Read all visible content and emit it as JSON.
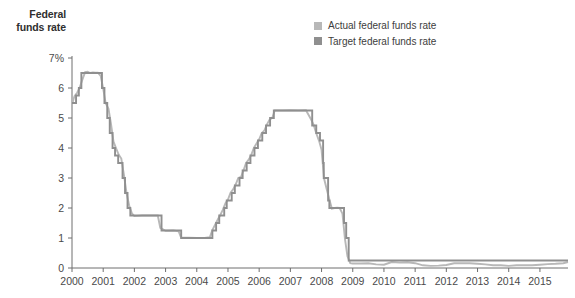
{
  "chart_data": {
    "type": "line",
    "title": "",
    "ylabel": "Federal funds rate",
    "xlabel": "",
    "ylim": [
      0,
      7
    ],
    "xlim": [
      2000,
      2015.9
    ],
    "grid": false,
    "legend_position": "top-center-right",
    "ytick_labels": [
      "7%",
      "6",
      "5",
      "4",
      "3",
      "2",
      "1",
      "0"
    ],
    "ytick_values": [
      7,
      6,
      5,
      4,
      3,
      2,
      1,
      0
    ],
    "xtick_labels": [
      "2000",
      "2001",
      "2002",
      "2003",
      "2004",
      "2005",
      "2006",
      "2007",
      "2008",
      "2009",
      "2010",
      "2011",
      "2012",
      "2013",
      "2014",
      "2015"
    ],
    "xtick_values": [
      2000,
      2001,
      2002,
      2003,
      2004,
      2005,
      2006,
      2007,
      2008,
      2009,
      2010,
      2011,
      2012,
      2013,
      2014,
      2015
    ],
    "colors": {
      "actual": "#b8b8b8",
      "target": "#8f8f8f",
      "axis": "#6e6e6e",
      "text": "#4a4a4a"
    },
    "series": [
      {
        "name": "Actual federal funds rate",
        "color": "#b8b8b8",
        "points": [
          [
            2000.0,
            5.45
          ],
          [
            2000.08,
            5.73
          ],
          [
            2000.17,
            5.85
          ],
          [
            2000.25,
            6.02
          ],
          [
            2000.33,
            6.27
          ],
          [
            2000.42,
            6.53
          ],
          [
            2000.5,
            6.54
          ],
          [
            2000.58,
            6.5
          ],
          [
            2000.67,
            6.52
          ],
          [
            2000.75,
            6.51
          ],
          [
            2000.83,
            6.51
          ],
          [
            2000.92,
            6.4
          ],
          [
            2001.0,
            5.98
          ],
          [
            2001.08,
            5.49
          ],
          [
            2001.17,
            5.31
          ],
          [
            2001.25,
            4.8
          ],
          [
            2001.33,
            4.21
          ],
          [
            2001.42,
            3.97
          ],
          [
            2001.5,
            3.77
          ],
          [
            2001.58,
            3.65
          ],
          [
            2001.67,
            3.07
          ],
          [
            2001.75,
            2.49
          ],
          [
            2001.83,
            2.09
          ],
          [
            2001.92,
            1.82
          ],
          [
            2002.0,
            1.73
          ],
          [
            2002.25,
            1.75
          ],
          [
            2002.5,
            1.75
          ],
          [
            2002.75,
            1.75
          ],
          [
            2002.83,
            1.34
          ],
          [
            2003.0,
            1.24
          ],
          [
            2003.25,
            1.25
          ],
          [
            2003.42,
            1.22
          ],
          [
            2003.5,
            1.01
          ],
          [
            2003.75,
            1.01
          ],
          [
            2004.0,
            1.0
          ],
          [
            2004.25,
            1.0
          ],
          [
            2004.42,
            1.03
          ],
          [
            2004.5,
            1.26
          ],
          [
            2004.58,
            1.43
          ],
          [
            2004.67,
            1.61
          ],
          [
            2004.75,
            1.76
          ],
          [
            2004.83,
            1.93
          ],
          [
            2004.92,
            2.16
          ],
          [
            2005.0,
            2.28
          ],
          [
            2005.08,
            2.5
          ],
          [
            2005.17,
            2.63
          ],
          [
            2005.25,
            2.79
          ],
          [
            2005.33,
            3.0
          ],
          [
            2005.42,
            3.04
          ],
          [
            2005.5,
            3.26
          ],
          [
            2005.58,
            3.5
          ],
          [
            2005.67,
            3.62
          ],
          [
            2005.75,
            3.78
          ],
          [
            2005.83,
            4.0
          ],
          [
            2005.92,
            4.16
          ],
          [
            2006.0,
            4.29
          ],
          [
            2006.08,
            4.49
          ],
          [
            2006.17,
            4.59
          ],
          [
            2006.25,
            4.79
          ],
          [
            2006.33,
            4.94
          ],
          [
            2006.42,
            5.0
          ],
          [
            2006.5,
            5.25
          ],
          [
            2006.58,
            5.25
          ],
          [
            2006.75,
            5.25
          ],
          [
            2007.0,
            5.26
          ],
          [
            2007.25,
            5.25
          ],
          [
            2007.5,
            5.26
          ],
          [
            2007.67,
            4.94
          ],
          [
            2007.75,
            4.76
          ],
          [
            2007.83,
            4.49
          ],
          [
            2007.92,
            4.24
          ],
          [
            2008.0,
            3.94
          ],
          [
            2008.08,
            2.98
          ],
          [
            2008.17,
            2.61
          ],
          [
            2008.25,
            2.28
          ],
          [
            2008.33,
            1.98
          ],
          [
            2008.42,
            2.0
          ],
          [
            2008.5,
            2.01
          ],
          [
            2008.58,
            2.0
          ],
          [
            2008.67,
            1.81
          ],
          [
            2008.75,
            0.97
          ],
          [
            2008.83,
            0.39
          ],
          [
            2008.92,
            0.16
          ],
          [
            2009.0,
            0.15
          ],
          [
            2009.25,
            0.15
          ],
          [
            2009.5,
            0.16
          ],
          [
            2009.75,
            0.12
          ],
          [
            2010.0,
            0.11
          ],
          [
            2010.25,
            0.2
          ],
          [
            2010.5,
            0.18
          ],
          [
            2010.75,
            0.19
          ],
          [
            2011.0,
            0.16
          ],
          [
            2011.25,
            0.09
          ],
          [
            2011.5,
            0.07
          ],
          [
            2011.75,
            0.08
          ],
          [
            2012.0,
            0.1
          ],
          [
            2012.25,
            0.16
          ],
          [
            2012.5,
            0.16
          ],
          [
            2012.75,
            0.16
          ],
          [
            2013.0,
            0.14
          ],
          [
            2013.25,
            0.12
          ],
          [
            2013.5,
            0.09
          ],
          [
            2013.75,
            0.09
          ],
          [
            2014.0,
            0.07
          ],
          [
            2014.25,
            0.09
          ],
          [
            2014.5,
            0.09
          ],
          [
            2014.75,
            0.09
          ],
          [
            2015.0,
            0.11
          ],
          [
            2015.25,
            0.13
          ],
          [
            2015.5,
            0.14
          ],
          [
            2015.75,
            0.16
          ],
          [
            2015.9,
            0.2
          ]
        ]
      },
      {
        "name": "Target federal funds rate",
        "color": "#8f8f8f",
        "points": [
          [
            2000.0,
            5.5
          ],
          [
            2000.13,
            5.5
          ],
          [
            2000.13,
            5.75
          ],
          [
            2000.22,
            5.75
          ],
          [
            2000.22,
            6.0
          ],
          [
            2000.3,
            6.0
          ],
          [
            2000.3,
            6.5
          ],
          [
            2000.96,
            6.5
          ],
          [
            2000.96,
            6.0
          ],
          [
            2001.04,
            6.0
          ],
          [
            2001.04,
            5.5
          ],
          [
            2001.13,
            5.5
          ],
          [
            2001.13,
            5.0
          ],
          [
            2001.21,
            5.0
          ],
          [
            2001.21,
            4.5
          ],
          [
            2001.3,
            4.5
          ],
          [
            2001.3,
            4.0
          ],
          [
            2001.38,
            4.0
          ],
          [
            2001.38,
            3.75
          ],
          [
            2001.48,
            3.75
          ],
          [
            2001.48,
            3.5
          ],
          [
            2001.62,
            3.5
          ],
          [
            2001.62,
            3.0
          ],
          [
            2001.7,
            3.0
          ],
          [
            2001.7,
            2.5
          ],
          [
            2001.78,
            2.5
          ],
          [
            2001.78,
            2.0
          ],
          [
            2001.87,
            2.0
          ],
          [
            2001.87,
            1.75
          ],
          [
            2002.87,
            1.75
          ],
          [
            2002.87,
            1.25
          ],
          [
            2003.5,
            1.25
          ],
          [
            2003.5,
            1.0
          ],
          [
            2004.5,
            1.0
          ],
          [
            2004.5,
            1.25
          ],
          [
            2004.62,
            1.25
          ],
          [
            2004.62,
            1.5
          ],
          [
            2004.72,
            1.5
          ],
          [
            2004.72,
            1.75
          ],
          [
            2004.88,
            1.75
          ],
          [
            2004.88,
            2.0
          ],
          [
            2004.96,
            2.0
          ],
          [
            2004.96,
            2.25
          ],
          [
            2005.12,
            2.25
          ],
          [
            2005.12,
            2.5
          ],
          [
            2005.22,
            2.5
          ],
          [
            2005.22,
            2.75
          ],
          [
            2005.37,
            2.75
          ],
          [
            2005.37,
            3.0
          ],
          [
            2005.47,
            3.0
          ],
          [
            2005.47,
            3.25
          ],
          [
            2005.6,
            3.25
          ],
          [
            2005.6,
            3.5
          ],
          [
            2005.72,
            3.5
          ],
          [
            2005.72,
            3.75
          ],
          [
            2005.85,
            3.75
          ],
          [
            2005.85,
            4.0
          ],
          [
            2005.96,
            4.0
          ],
          [
            2005.96,
            4.25
          ],
          [
            2006.1,
            4.25
          ],
          [
            2006.1,
            4.5
          ],
          [
            2006.22,
            4.5
          ],
          [
            2006.22,
            4.75
          ],
          [
            2006.35,
            4.75
          ],
          [
            2006.35,
            5.0
          ],
          [
            2006.47,
            5.0
          ],
          [
            2006.47,
            5.25
          ],
          [
            2007.7,
            5.25
          ],
          [
            2007.7,
            4.75
          ],
          [
            2007.83,
            4.75
          ],
          [
            2007.83,
            4.5
          ],
          [
            2007.95,
            4.5
          ],
          [
            2007.95,
            4.25
          ],
          [
            2008.05,
            4.25
          ],
          [
            2008.05,
            3.5
          ],
          [
            2008.07,
            3.5
          ],
          [
            2008.07,
            3.0
          ],
          [
            2008.21,
            3.0
          ],
          [
            2008.21,
            2.25
          ],
          [
            2008.25,
            2.25
          ],
          [
            2008.25,
            2.0
          ],
          [
            2008.72,
            2.0
          ],
          [
            2008.72,
            1.5
          ],
          [
            2008.79,
            1.5
          ],
          [
            2008.79,
            1.0
          ],
          [
            2008.87,
            1.0
          ],
          [
            2008.87,
            0.25
          ],
          [
            2015.9,
            0.25
          ]
        ]
      }
    ]
  },
  "legend": {
    "items": [
      {
        "label": "Actual federal funds rate",
        "color": "#b8b8b8"
      },
      {
        "label": "Target federal funds rate",
        "color": "#8f8f8f"
      }
    ]
  },
  "axis_title": {
    "line1": "Federal",
    "line2": "funds rate"
  }
}
